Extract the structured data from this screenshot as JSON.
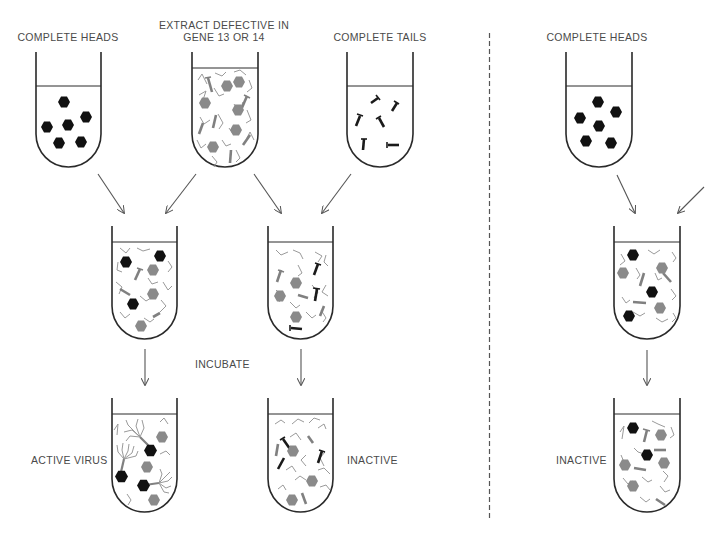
{
  "labels": {
    "heads_left": "COMPLETE HEADS",
    "extract_line1": "EXTRACT DEFECTIVE IN",
    "extract_line2": "GENE 13 OR 14",
    "tails": "COMPLETE TAILS",
    "heads_right": "COMPLETE HEADS",
    "incubate": "INCUBATE",
    "active_virus": "ACTIVE VIRUS",
    "inactive_middle": "INACTIVE",
    "inactive_right": "INACTIVE"
  },
  "colors": {
    "outline": "#2a2a2a",
    "head_complete": "#111111",
    "head_defective": "#8a8a8a",
    "fragment": "#9a9a9a",
    "tail_complete": "#1a1a1a",
    "tail_defective": "#808080",
    "arrow": "#555555",
    "divider": "#555555"
  },
  "tubes": [
    {
      "id": "complete-heads-left",
      "x": 36,
      "y": 52,
      "w": 65,
      "h": 115,
      "liquid": 34
    },
    {
      "id": "extract-defective",
      "x": 192,
      "y": 52,
      "w": 66,
      "h": 115,
      "liquid": 16
    },
    {
      "id": "complete-tails",
      "x": 347,
      "y": 52,
      "w": 66,
      "h": 115,
      "liquid": 34
    },
    {
      "id": "mix-heads-extract",
      "x": 112,
      "y": 226,
      "w": 65,
      "h": 113,
      "liquid": 16
    },
    {
      "id": "mix-tails-extract",
      "x": 268,
      "y": 226,
      "w": 65,
      "h": 113,
      "liquid": 16
    },
    {
      "id": "result-active-virus",
      "x": 112,
      "y": 398,
      "w": 65,
      "h": 113,
      "liquid": 16
    },
    {
      "id": "result-inactive-middle",
      "x": 268,
      "y": 398,
      "w": 65,
      "h": 113,
      "liquid": 16
    },
    {
      "id": "complete-heads-right",
      "x": 566,
      "y": 52,
      "w": 66,
      "h": 115,
      "liquid": 34
    },
    {
      "id": "mix-heads-right",
      "x": 614,
      "y": 226,
      "w": 66,
      "h": 113,
      "liquid": 16
    },
    {
      "id": "result-inactive-right",
      "x": 614,
      "y": 398,
      "w": 66,
      "h": 113,
      "liquid": 16
    }
  ]
}
